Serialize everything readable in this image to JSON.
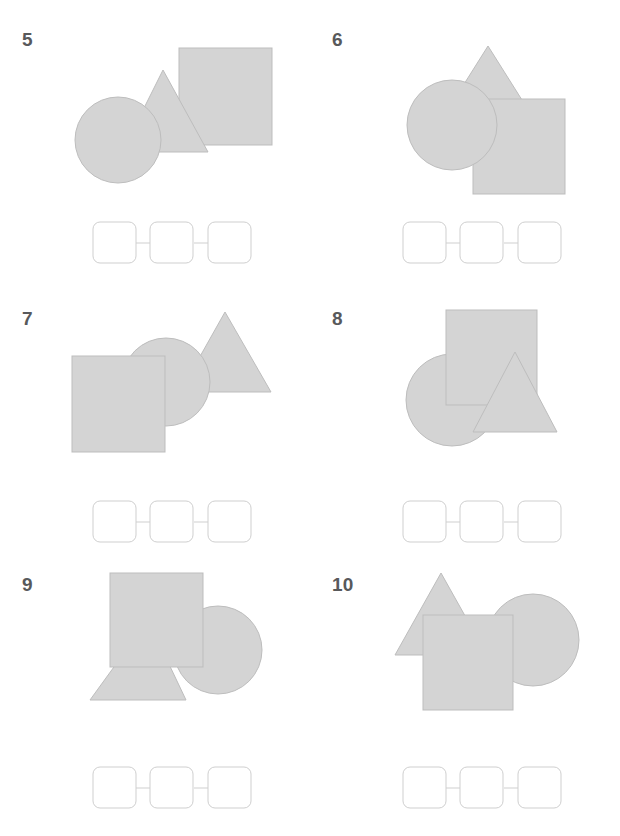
{
  "page": {
    "background_color": "#ffffff",
    "shape_fill": "#d4d4d4",
    "shape_stroke": "#bdbdbd",
    "number_color": "#58595b",
    "box_stroke": "#cfcfcf",
    "box_fill": "#ffffff",
    "width": 620,
    "height": 836
  },
  "problems": [
    {
      "number": "5",
      "shapes_back_to_front": [
        "square",
        "triangle",
        "circle"
      ],
      "shape_labels": [
        "circle",
        "triangle",
        "square"
      ],
      "answer_boxes": [
        "",
        "",
        ""
      ]
    },
    {
      "number": "6",
      "shapes_back_to_front": [
        "triangle",
        "square",
        "circle"
      ],
      "shape_labels": [
        "circle",
        "triangle",
        "square"
      ],
      "answer_boxes": [
        "",
        "",
        ""
      ]
    },
    {
      "number": "7",
      "shapes_back_to_front": [
        "triangle",
        "circle",
        "square"
      ],
      "shape_labels": [
        "circle",
        "triangle",
        "square"
      ],
      "answer_boxes": [
        "",
        "",
        ""
      ]
    },
    {
      "number": "8",
      "shapes_back_to_front": [
        "circle",
        "square",
        "triangle"
      ],
      "shape_labels": [
        "circle",
        "triangle",
        "square"
      ],
      "answer_boxes": [
        "",
        "",
        ""
      ]
    },
    {
      "number": "9",
      "shapes_back_to_front": [
        "triangle",
        "circle",
        "square"
      ],
      "shape_labels": [
        "circle",
        "triangle",
        "square"
      ],
      "answer_boxes": [
        "",
        "",
        ""
      ]
    },
    {
      "number": "10",
      "shapes_back_to_front": [
        "triangle",
        "circle",
        "square"
      ],
      "shape_labels": [
        "circle",
        "triangle",
        "square"
      ],
      "answer_boxes": [
        "",
        "",
        ""
      ]
    }
  ]
}
